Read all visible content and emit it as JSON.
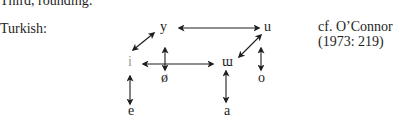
{
  "heading": "Third, rounding:",
  "language_label": "Turkish:",
  "citation": {
    "line1": "cf. O’Connor",
    "line2": "(1973: 219)"
  },
  "vowels": {
    "y": "y",
    "u": "u",
    "i": "i",
    "oe": "ø",
    "uu": "ɯ",
    "o": "o",
    "e": "e",
    "a": "a"
  },
  "arrows": [
    {
      "from": "y",
      "to": "u",
      "type": "double-horizontal"
    },
    {
      "from": "i",
      "to": "y",
      "type": "double-diagonal"
    },
    {
      "from": "i",
      "to": "ɯ",
      "type": "double-horizontal"
    },
    {
      "from": "ø",
      "to": "ø",
      "type": "double-vertical"
    },
    {
      "from": "u",
      "to": "ɯ",
      "type": "double-diagonal"
    },
    {
      "from": "o",
      "to": "o",
      "type": "double-vertical"
    },
    {
      "from": "i",
      "to": "e",
      "type": "double-vertical"
    },
    {
      "from": "ɯ",
      "to": "a",
      "type": "double-vertical"
    }
  ]
}
